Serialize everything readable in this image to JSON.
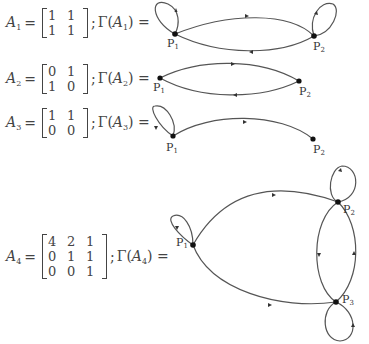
{
  "equations": [
    {
      "name": "A",
      "index": "1",
      "matrix": [
        [
          "1",
          "1"
        ],
        [
          "1",
          "1"
        ]
      ],
      "gamma_label": "Γ(",
      "gamma_close": ") =",
      "graph": {
        "nodes": [
          "P1",
          "P2"
        ],
        "edges": [
          {
            "from": "P1",
            "to": "P1",
            "type": "loop"
          },
          {
            "from": "P1",
            "to": "P2"
          },
          {
            "from": "P2",
            "to": "P1"
          },
          {
            "from": "P2",
            "to": "P2",
            "type": "loop"
          }
        ]
      }
    },
    {
      "name": "A",
      "index": "2",
      "matrix": [
        [
          "0",
          "1"
        ],
        [
          "1",
          "0"
        ]
      ],
      "gamma_label": "Γ(",
      "gamma_close": ") =",
      "graph": {
        "nodes": [
          "P1",
          "P2"
        ],
        "edges": [
          {
            "from": "P1",
            "to": "P2"
          },
          {
            "from": "P2",
            "to": "P1"
          }
        ]
      }
    },
    {
      "name": "A",
      "index": "3",
      "matrix": [
        [
          "1",
          "1"
        ],
        [
          "0",
          "0"
        ]
      ],
      "gamma_label": "Γ(",
      "gamma_close": ") =",
      "graph": {
        "nodes": [
          "P1",
          "P2"
        ],
        "edges": [
          {
            "from": "P1",
            "to": "P1",
            "type": "loop"
          },
          {
            "from": "P1",
            "to": "P2"
          }
        ]
      }
    },
    {
      "name": "A",
      "index": "4",
      "matrix": [
        [
          "4",
          "2",
          "1"
        ],
        [
          "0",
          "1",
          "1"
        ],
        [
          "0",
          "0",
          "1"
        ]
      ],
      "gamma_label": "Γ(",
      "gamma_close": ") =",
      "graph": {
        "nodes": [
          "P1",
          "P2",
          "P3"
        ],
        "edges": [
          {
            "from": "P1",
            "to": "P1",
            "type": "loop"
          },
          {
            "from": "P1",
            "to": "P2"
          },
          {
            "from": "P1",
            "to": "P3"
          },
          {
            "from": "P2",
            "to": "P2",
            "type": "loop"
          },
          {
            "from": "P2",
            "to": "P3"
          },
          {
            "from": "P3",
            "to": "P2"
          },
          {
            "from": "P3",
            "to": "P3",
            "type": "loop"
          }
        ]
      }
    }
  ],
  "node_labels": {
    "P": "P",
    "s1": "1",
    "s2": "2",
    "s3": "3"
  },
  "colors": {
    "edge": "#555555",
    "node": "#111111",
    "text": "#444444"
  }
}
